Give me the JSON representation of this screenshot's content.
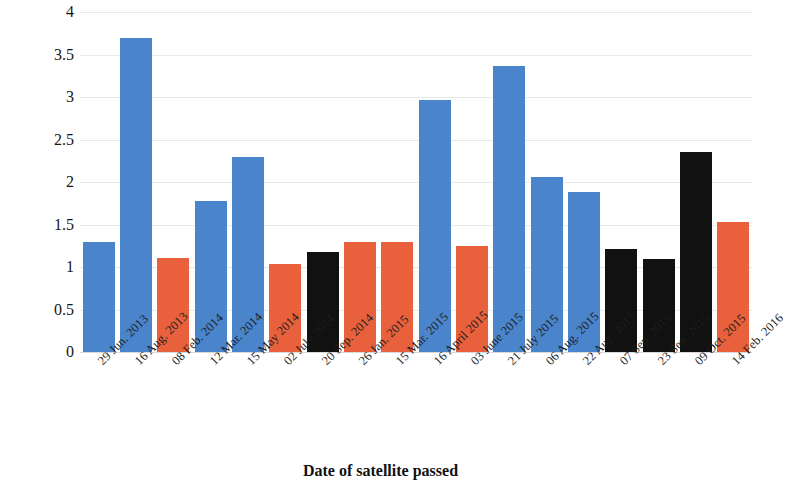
{
  "chart_data": {
    "type": "bar",
    "title": "",
    "xlabel": "Date of satellite passed",
    "ylabel": "Turbidity(FTU)",
    "ylim": [
      0,
      4
    ],
    "ytick_labels": [
      "4",
      "3.5",
      "3",
      "2.5",
      "2",
      "1.5",
      "1",
      "0.5",
      "0"
    ],
    "ytick_values": [
      4,
      3.5,
      3,
      2.5,
      2,
      1.5,
      1,
      0.5,
      0
    ],
    "grid": true,
    "legend": "none",
    "categories": [
      "29 Jun. 2013",
      "16 Aug. 2013",
      "08 Feb. 2014",
      "12 Mar. 2014",
      "15 May 2014",
      "02 July 2014",
      "20 Sep. 2014",
      "26 Jan. 2015",
      "15 Mar. 2015",
      "16 April 2015",
      "03 June 2015",
      "21 July 2015",
      "06 Aug. 2015",
      "22 Aug. 2015",
      "07 Sep. 2015",
      "23 Sep. 2015",
      "09 Oct. 2015",
      "14 Feb. 2016"
    ],
    "values": [
      1.3,
      3.7,
      1.11,
      1.78,
      2.3,
      1.03,
      1.18,
      1.3,
      1.3,
      2.97,
      1.25,
      3.36,
      2.06,
      1.88,
      1.21,
      1.09,
      2.35,
      1.53
    ],
    "bar_colors": [
      "#4a85cc",
      "#4a85cc",
      "#e8613c",
      "#4a85cc",
      "#4a85cc",
      "#e8613c",
      "#111111",
      "#e8613c",
      "#e8613c",
      "#4a85cc",
      "#e8613c",
      "#4a85cc",
      "#4a85cc",
      "#4a85cc",
      "#111111",
      "#111111",
      "#111111",
      "#e8613c"
    ],
    "color_blue": "#4a85cc",
    "color_orange": "#e8613c",
    "color_black": "#111111",
    "grid_color": "#e9e9e9",
    "background": "#ffffff"
  }
}
